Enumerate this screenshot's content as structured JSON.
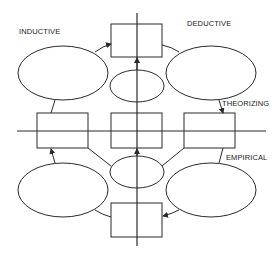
{
  "diagram": {
    "labels": {
      "inductive": "INDUCTIVE",
      "deductive": "DEDUCTIVE",
      "theorizing": "THEORIZING",
      "empirical": "EMPIRICAL"
    },
    "axes": {
      "vertical": {
        "x": 137,
        "y1": 13,
        "y2": 246,
        "arrow": "none"
      },
      "horizontal": {
        "y": 131,
        "x1": 17,
        "x2": 266
      }
    },
    "boxes": [
      {
        "id": "top",
        "x": 111,
        "y": 24,
        "w": 51,
        "h": 33
      },
      {
        "id": "left",
        "x": 37,
        "y": 113,
        "w": 51,
        "h": 35
      },
      {
        "id": "center",
        "x": 111,
        "y": 113,
        "w": 51,
        "h": 35
      },
      {
        "id": "right",
        "x": 184,
        "y": 113,
        "w": 51,
        "h": 35
      },
      {
        "id": "bottom",
        "x": 111,
        "y": 203,
        "w": 51,
        "h": 34
      }
    ],
    "ellipses": [
      {
        "id": "top-left",
        "cx": 63,
        "cy": 73,
        "rx": 45,
        "ry": 27
      },
      {
        "id": "top-right",
        "cx": 211,
        "cy": 73,
        "rx": 45,
        "ry": 27
      },
      {
        "id": "top-center",
        "cx": 137,
        "cy": 86,
        "rx": 27,
        "ry": 16
      },
      {
        "id": "bottom-center",
        "cx": 137,
        "cy": 172,
        "rx": 27,
        "ry": 16
      },
      {
        "id": "bottom-left",
        "cx": 63,
        "cy": 190,
        "rx": 45,
        "ry": 27
      },
      {
        "id": "bottom-right",
        "cx": 211,
        "cy": 190,
        "rx": 45,
        "ry": 27
      }
    ],
    "colors": {
      "stroke": "#2a2a2a",
      "background": "#ffffff",
      "text": "#1a1a1a"
    }
  }
}
